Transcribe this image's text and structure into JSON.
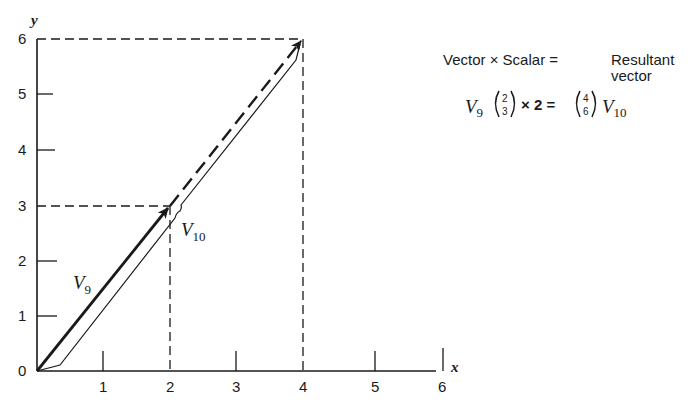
{
  "axes": {
    "x_label": "x",
    "y_label": "y",
    "x_ticks": [
      "1",
      "2",
      "3",
      "4",
      "5",
      "6"
    ],
    "y_ticks": [
      "1",
      "2",
      "3",
      "4",
      "5",
      "6"
    ],
    "origin_label": "0"
  },
  "vectors": {
    "v9": {
      "label": "V",
      "subscript": "9",
      "from": [
        0,
        0
      ],
      "to": [
        2,
        3
      ]
    },
    "v10": {
      "label": "V",
      "subscript": "10",
      "from": [
        0,
        0
      ],
      "to": [
        4,
        6
      ]
    }
  },
  "legend": {
    "header_left": "Vector × Scalar =",
    "header_right_line1": "Resultant",
    "header_right_line2": "vector",
    "eq_v": "V",
    "eq_v_sub": "9",
    "eq_matrix_left_top": "2",
    "eq_matrix_left_bottom": "3",
    "eq_times": "× 2 =",
    "eq_matrix_right_top": "4",
    "eq_matrix_right_bottom": "6",
    "eq_result_v": "V",
    "eq_result_sub": "10"
  },
  "colors": {
    "ink": "#1a1a1a",
    "background": "#ffffff"
  }
}
